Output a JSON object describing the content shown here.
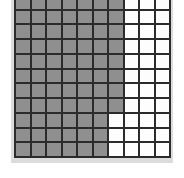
{
  "figure": {
    "title": ""
  },
  "colors": {
    "filled": "#8f8f8f",
    "empty": "#fdfdfd",
    "gridline": "#2b2b2b",
    "backdrop": "#dcdcdc",
    "page": "#ffffff"
  },
  "grid": {
    "columns": 10,
    "rows": 11,
    "filled_label": "shaded",
    "empty_label": "unshaded",
    "row_filled_counts": [
      7,
      7,
      7,
      7,
      7,
      7,
      7,
      7,
      6,
      6,
      6
    ],
    "cells": [
      [
        1,
        1,
        1,
        1,
        1,
        1,
        1,
        0,
        0,
        0
      ],
      [
        1,
        1,
        1,
        1,
        1,
        1,
        1,
        0,
        0,
        0
      ],
      [
        1,
        1,
        1,
        1,
        1,
        1,
        1,
        0,
        0,
        0
      ],
      [
        1,
        1,
        1,
        1,
        1,
        1,
        1,
        0,
        0,
        0
      ],
      [
        1,
        1,
        1,
        1,
        1,
        1,
        1,
        0,
        0,
        0
      ],
      [
        1,
        1,
        1,
        1,
        1,
        1,
        1,
        0,
        0,
        0
      ],
      [
        1,
        1,
        1,
        1,
        1,
        1,
        1,
        0,
        0,
        0
      ],
      [
        1,
        1,
        1,
        1,
        1,
        1,
        1,
        0,
        0,
        0
      ],
      [
        1,
        1,
        1,
        1,
        1,
        1,
        0,
        0,
        0,
        0
      ],
      [
        1,
        1,
        1,
        1,
        1,
        1,
        0,
        0,
        0,
        0
      ],
      [
        1,
        1,
        1,
        1,
        1,
        1,
        0,
        0,
        0,
        0
      ]
    ],
    "total_cells": 110,
    "total_filled": 74,
    "total_empty": 36
  }
}
